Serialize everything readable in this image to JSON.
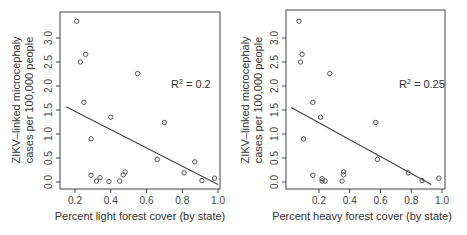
{
  "chart_data": [
    {
      "type": "scatter",
      "title": "",
      "xlabel": "Percent light forest cover (by state)",
      "ylabel": "ZIKV–linked microcephaly cases per 100,000 people",
      "ylabel_lines": [
        "ZIKV–linked microcephaly",
        "cases per 100,000 people"
      ],
      "xticks": [
        "0.2",
        "0.4",
        "0.6",
        "0.8",
        "1.0"
      ],
      "yticks": [
        "0.0",
        "0.5",
        "1.0",
        "1.5",
        "2.0",
        "2.5",
        "3.0"
      ],
      "xlim": [
        0.15,
        1.0
      ],
      "ylim": [
        -0.05,
        3.45
      ],
      "annotation": "R² = 0.2",
      "r2_label": "R",
      "r2_value": " = 0.2",
      "grid": false,
      "x": [
        0.21,
        0.23,
        0.26,
        0.25,
        0.29,
        0.29,
        0.32,
        0.34,
        0.39,
        0.4,
        0.45,
        0.47,
        0.48,
        0.55,
        0.66,
        0.7,
        0.81,
        0.87,
        0.91,
        0.98
      ],
      "y": [
        3.35,
        2.5,
        2.66,
        1.66,
        0.9,
        0.14,
        0.02,
        0.09,
        0.01,
        1.35,
        0.02,
        0.15,
        0.21,
        2.26,
        0.47,
        1.24,
        0.19,
        0.42,
        0.03,
        0.08
      ],
      "fit_line": {
        "x": [
          0.15,
          1.0
        ],
        "y": [
          1.57,
          -0.05
        ]
      }
    },
    {
      "type": "scatter",
      "title": "",
      "xlabel": "Percent heavy forest cover (by state)",
      "ylabel": "ZIKV–linked microcephaly cases per 100,000 people",
      "ylabel_lines": [
        "ZIKV–linked microcephaly",
        "cases per 100,000 people"
      ],
      "xticks": [
        "0.2",
        "0.4",
        "0.6",
        "0.8",
        "1.0"
      ],
      "yticks": [
        "0.0",
        "0.5",
        "1.0",
        "1.5",
        "2.0",
        "2.5",
        "3.0"
      ],
      "xlim": [
        0.02,
        1.0
      ],
      "ylim": [
        -0.05,
        3.45
      ],
      "annotation": "R² = 0.25",
      "r2_label": "R",
      "r2_value": " = 0.25",
      "grid": false,
      "x": [
        0.07,
        0.08,
        0.09,
        0.16,
        0.1,
        0.16,
        0.22,
        0.22,
        0.24,
        0.21,
        0.35,
        0.36,
        0.36,
        0.27,
        0.58,
        0.57,
        0.78,
        0.87,
        0.98
      ],
      "y": [
        3.35,
        2.5,
        2.66,
        1.66,
        0.9,
        0.14,
        0.07,
        0.02,
        0.02,
        1.35,
        0.02,
        0.15,
        0.21,
        2.26,
        0.47,
        1.24,
        0.19,
        0.03,
        0.08
      ],
      "fit_line": {
        "x": [
          0.02,
          0.93
        ],
        "y": [
          1.55,
          -0.05
        ]
      }
    }
  ]
}
